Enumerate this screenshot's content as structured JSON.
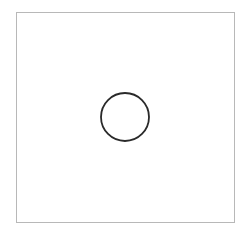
{
  "diagram": {
    "background": "#ffffff",
    "frame": {
      "x": 16,
      "y": 12,
      "width": 219,
      "height": 211,
      "border_color": "#b8b8b8"
    },
    "shapes": [
      {
        "type": "circle",
        "cx": 125,
        "cy": 117,
        "r": 24,
        "stroke": "#2a2a2a",
        "stroke_width": 1.8,
        "fill": "none"
      }
    ]
  }
}
